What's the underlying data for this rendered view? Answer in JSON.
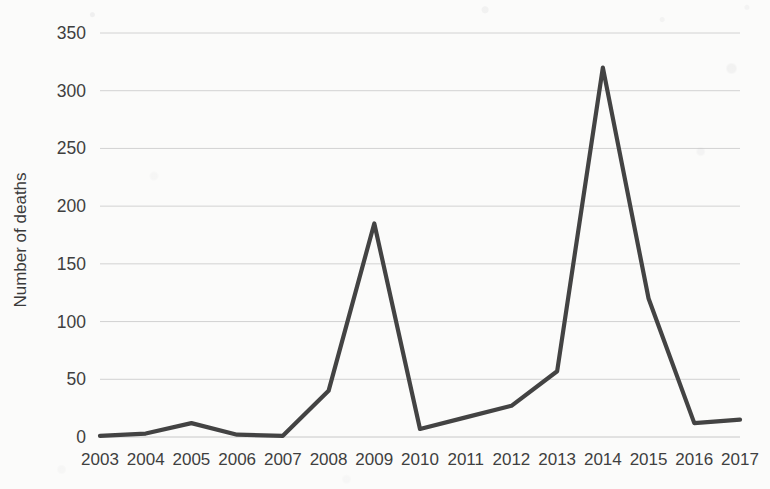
{
  "chart_data": {
    "type": "line",
    "title": "",
    "xlabel": "",
    "ylabel": "Number of deaths",
    "categories": [
      "2003",
      "2004",
      "2005",
      "2006",
      "2007",
      "2008",
      "2009",
      "2010",
      "2011",
      "2012",
      "2013",
      "2014",
      "2015",
      "2016",
      "2017"
    ],
    "values": [
      1,
      3,
      12,
      2,
      1,
      40,
      185,
      7,
      17,
      27,
      57,
      320,
      120,
      12,
      15
    ],
    "series": [
      {
        "name": "Number of deaths",
        "values": [
          1,
          3,
          12,
          2,
          1,
          40,
          185,
          7,
          17,
          27,
          57,
          320,
          120,
          12,
          15
        ]
      }
    ],
    "ylim": [
      0,
      350
    ],
    "ytick_labels": [
      "0",
      "50",
      "100",
      "150",
      "200",
      "250",
      "300",
      "350"
    ],
    "ytick_values": [
      0,
      50,
      100,
      150,
      200,
      250,
      300,
      350
    ],
    "grid": "horizontal",
    "legend": "none",
    "markers": "none",
    "line_color": "#434343",
    "grid_color": "#d2d2d2",
    "background_color": "#fbfbfa"
  }
}
